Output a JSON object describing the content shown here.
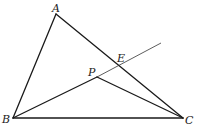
{
  "diagram": {
    "type": "geometry",
    "points": {
      "A": {
        "label": "A"
      },
      "B": {
        "label": "B"
      },
      "C": {
        "label": "C"
      },
      "P": {
        "label": "P"
      },
      "E": {
        "label": "E"
      }
    },
    "segments": [
      "AB",
      "AC",
      "BC",
      "BP",
      "PC",
      "PE"
    ],
    "rays": [
      "BE (extended beyond E)"
    ]
  }
}
